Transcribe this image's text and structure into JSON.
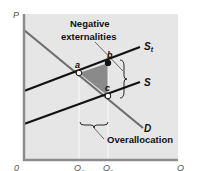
{
  "diagram": {
    "axes": {
      "y_label": "P",
      "x_label": "Q",
      "origin_label": "0",
      "x_ticks": [
        {
          "main": "Q",
          "sub": "o"
        },
        {
          "main": "Q",
          "sub": "e"
        }
      ]
    },
    "curves": {
      "demand": {
        "main": "D",
        "sub": ""
      },
      "supply": {
        "main": "S",
        "sub": ""
      },
      "supply_total": {
        "main": "S",
        "sub": "t"
      }
    },
    "points": {
      "a": "a",
      "b": "b",
      "c": "c"
    },
    "annotations": {
      "negative_externalities_line1": "Negative",
      "negative_externalities_line2": "externalities",
      "overallocation": "Overallocation"
    },
    "colors": {
      "plot_background": "#e6e6e6",
      "axis": "#8c8c8c",
      "demand": "#6e6e6e",
      "supply": "#111111",
      "shaded_area": "#8a8a8a"
    }
  }
}
